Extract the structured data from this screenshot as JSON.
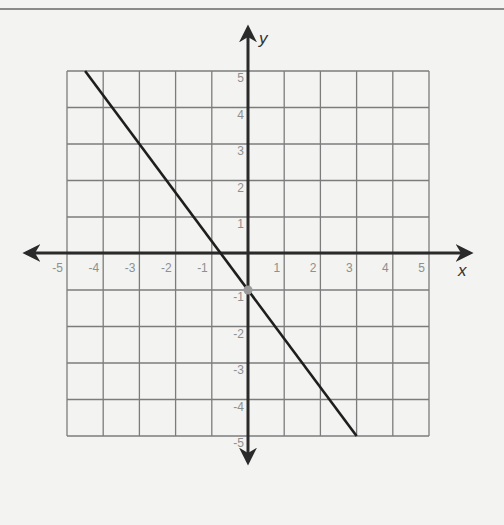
{
  "chart_data": {
    "type": "line",
    "title": "",
    "xlabel": "x",
    "ylabel": "y",
    "xlim": [
      -5,
      5
    ],
    "ylim": [
      -5,
      5
    ],
    "grid": true,
    "x_ticks": [
      "-5",
      "-4",
      "-3",
      "-2",
      "-1",
      "1",
      "2",
      "3",
      "4",
      "5"
    ],
    "y_ticks": [
      "5",
      "4",
      "3",
      "2",
      "1",
      "-1",
      "-2",
      "-3",
      "-4",
      "-5"
    ],
    "series": [
      {
        "name": "line",
        "equation": "y = -4/3 x - 1",
        "slope": -1.333,
        "intercept": -1,
        "x": [
          -4.5,
          3
        ],
        "y": [
          5,
          -5
        ]
      }
    ],
    "points": [
      {
        "label": "y-intercept",
        "x": 0,
        "y": -1
      }
    ],
    "colors": {
      "line": "#1e1e1e",
      "grid": "#7c7c7c",
      "point": "#9a9a9a",
      "tick": "#8f8f8f"
    }
  }
}
